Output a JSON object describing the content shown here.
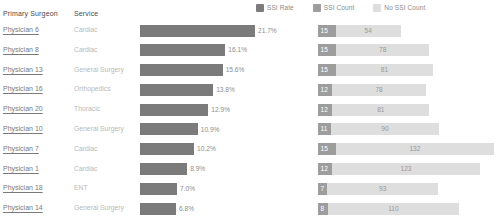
{
  "legend": {
    "items": [
      {
        "label": "SSI Rate",
        "color": "#7b7b7b",
        "icon": "legend-swatch-icon"
      },
      {
        "label": "SSI Count",
        "color": "#9d9d9d",
        "icon": "legend-swatch-icon"
      },
      {
        "label": "No SSI Count",
        "color": "#dedede",
        "icon": "legend-swatch-icon"
      }
    ]
  },
  "columns": {
    "surgeon": "Primary Surgeon",
    "service": "Service"
  },
  "chart_data": {
    "type": "bar",
    "title": "",
    "xlabel": "",
    "ylabel": "",
    "grid": false,
    "legend_position": "top-right",
    "categories": [
      "Physician 6",
      "Physician 8",
      "Physician 13",
      "Physician 16",
      "Physician 20",
      "Physician 10",
      "Physician 7",
      "Physician 1",
      "Physician 18",
      "Physician 14"
    ],
    "services": [
      "Cardiac",
      "Cardiac",
      "General Surgery",
      "Orthopedics",
      "Thoracic",
      "General Surgery",
      "Cardiac",
      "Cardiac",
      "ENT",
      "General Surgery"
    ],
    "series": [
      {
        "name": "SSI Rate",
        "values": [
          21.7,
          16.1,
          15.6,
          13.8,
          12.9,
          10.9,
          10.2,
          8.9,
          7.0,
          6.8
        ],
        "labels": [
          "21.7%",
          "16.1%",
          "15.6%",
          "13.8%",
          "12.9%",
          "10.9%",
          "10.2%",
          "8.9%",
          "7.0%",
          "6.8%"
        ]
      },
      {
        "name": "SSI Count",
        "values": [
          15,
          15,
          15,
          12,
          12,
          11,
          15,
          12,
          7,
          8
        ]
      },
      {
        "name": "No SSI Count",
        "values": [
          54,
          78,
          81,
          78,
          81,
          90,
          132,
          123,
          93,
          110
        ]
      }
    ],
    "rate_axis_max": 21.7,
    "count_axis_max": 147
  },
  "rows": [
    {
      "surgeon": "Physician 6",
      "service": "Cardiac",
      "rate_label": "21.7%",
      "rate": 21.7,
      "ssi": "15",
      "no_ssi": "54"
    },
    {
      "surgeon": "Physician 8",
      "service": "Cardiac",
      "rate_label": "16.1%",
      "rate": 16.1,
      "ssi": "15",
      "no_ssi": "78"
    },
    {
      "surgeon": "Physician 13",
      "service": "General Surgery",
      "rate_label": "15.6%",
      "rate": 15.6,
      "ssi": "15",
      "no_ssi": "81"
    },
    {
      "surgeon": "Physician 16",
      "service": "Orthopedics",
      "rate_label": "13.8%",
      "rate": 13.8,
      "ssi": "12",
      "no_ssi": "78"
    },
    {
      "surgeon": "Physician 20",
      "service": "Thoracic",
      "rate_label": "12.9%",
      "rate": 12.9,
      "ssi": "12",
      "no_ssi": "81"
    },
    {
      "surgeon": "Physician 10",
      "service": "General Surgery",
      "rate_label": "10.9%",
      "rate": 10.9,
      "ssi": "11",
      "no_ssi": "90"
    },
    {
      "surgeon": "Physician 7",
      "service": "Cardiac",
      "rate_label": "10.2%",
      "rate": 10.2,
      "ssi": "15",
      "no_ssi": "132"
    },
    {
      "surgeon": "Physician 1",
      "service": "Cardiac",
      "rate_label": "8.9%",
      "rate": 8.9,
      "ssi": "12",
      "no_ssi": "123"
    },
    {
      "surgeon": "Physician 18",
      "service": "ENT",
      "rate_label": "7.0%",
      "rate": 7.0,
      "ssi": "7",
      "no_ssi": "93"
    },
    {
      "surgeon": "Physician 14",
      "service": "General Surgery",
      "rate_label": "6.8%",
      "rate": 6.8,
      "ssi": "8",
      "no_ssi": "110"
    }
  ]
}
